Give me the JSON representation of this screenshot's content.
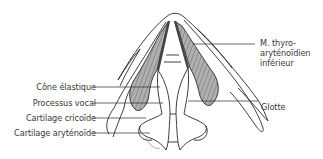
{
  "diagram": {
    "type": "anatomical-illustration",
    "colors": {
      "line": "#2a2a2a",
      "muscle_fill": "#a9a9a9",
      "muscle_stripe": "#555555",
      "background": "#ffffff",
      "label_text": "#3a3a3a"
    },
    "labels_left": [
      {
        "id": "cone-elastique",
        "text": "Cône élastique"
      },
      {
        "id": "processus-vocal",
        "text": "Processus vocal"
      },
      {
        "id": "cartilage-cricoide",
        "text": "Cartilage cricoïde"
      },
      {
        "id": "cartilage-arytenoide",
        "text": "Cartilage aryténoïde"
      }
    ],
    "labels_right": [
      {
        "id": "m-thyro-arytenoidien",
        "lines": [
          "M. thyro-",
          "aryténoïdien",
          "inférieur"
        ]
      },
      {
        "id": "glotte",
        "text": "Glotte"
      }
    ]
  }
}
